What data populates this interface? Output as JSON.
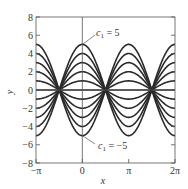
{
  "chart_data": {
    "type": "line",
    "title": "",
    "function": "y = c1 * cos(x)",
    "xlabel": "x",
    "ylabel": "y",
    "xlim": [
      -3.14159,
      6.28319
    ],
    "ylim": [
      -8,
      8
    ],
    "grid": false,
    "legend": null,
    "x_ticks": [
      {
        "value": -3.14159,
        "label": "−π"
      },
      {
        "value": 0,
        "label": "0"
      },
      {
        "value": 3.14159,
        "label": "π"
      },
      {
        "value": 6.28319,
        "label": "2π"
      }
    ],
    "y_ticks": [
      {
        "value": -8,
        "label": "−8"
      },
      {
        "value": -6,
        "label": "−6"
      },
      {
        "value": -4,
        "label": "−4"
      },
      {
        "value": -2,
        "label": "−2"
      },
      {
        "value": 0,
        "label": "0"
      },
      {
        "value": 2,
        "label": "2"
      },
      {
        "value": 4,
        "label": "4"
      },
      {
        "value": 6,
        "label": "6"
      },
      {
        "value": 8,
        "label": "8"
      }
    ],
    "series": [
      {
        "name": "c1 = -5",
        "c1": -5
      },
      {
        "name": "c1 = -4",
        "c1": -4
      },
      {
        "name": "c1 = -3",
        "c1": -3
      },
      {
        "name": "c1 = -2",
        "c1": -2
      },
      {
        "name": "c1 = -1",
        "c1": -1
      },
      {
        "name": "c1 = 0",
        "c1": 0
      },
      {
        "name": "c1 = 1",
        "c1": 1
      },
      {
        "name": "c1 = 2",
        "c1": 2
      },
      {
        "name": "c1 = 3",
        "c1": 3
      },
      {
        "name": "c1 = 4",
        "c1": 4
      },
      {
        "name": "c1 = 5",
        "c1": 5
      }
    ],
    "annotations": [
      {
        "text": "c1 = 5",
        "points_to": {
          "x": 0,
          "y": 5
        }
      },
      {
        "text": "c1 = −5",
        "points_to": {
          "x": 0,
          "y": -5
        }
      }
    ]
  },
  "labels": {
    "x_axis": "x",
    "y_axis": "y",
    "annot_top_var": "c",
    "annot_top_sub": "1",
    "annot_top_val": " = 5",
    "annot_bot_var": "c",
    "annot_bot_sub": "1",
    "annot_bot_val": " = −5"
  },
  "layout": {
    "plot_left": 36,
    "plot_right": 175,
    "plot_top": 17,
    "plot_bottom": 163,
    "line_color": "#2a2a2a",
    "axis_color": "#555555"
  }
}
